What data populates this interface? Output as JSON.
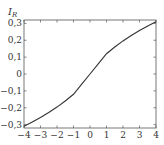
{
  "chart_data": {
    "type": "line",
    "title": "",
    "xlabel": "",
    "ylabel": "I_R",
    "ylabel_main": "I",
    "ylabel_sub": "R",
    "xlim": [
      -4,
      4
    ],
    "ylim": [
      -0.32,
      0.32
    ],
    "grid": false,
    "legend": null,
    "x_ticks": [
      -4,
      -3,
      -2,
      -1,
      0,
      1,
      2,
      3,
      4
    ],
    "x_tick_labels": [
      "−4",
      "−3",
      "−2",
      "−1",
      "0",
      "1",
      "2",
      "3",
      "4"
    ],
    "y_ticks": [
      -0.3,
      -0.2,
      -0.1,
      0,
      0.1,
      0.2,
      0.3
    ],
    "y_tick_labels": [
      "−0,3",
      "−0,2",
      "−0,1",
      "0",
      "0,1",
      "0,2",
      "0,3"
    ],
    "series": [
      {
        "name": "I_R",
        "color": "#333333",
        "x": [
          -4,
          -3.5,
          -3,
          -2.5,
          -2,
          -1.5,
          -1,
          -0.5,
          0,
          0.5,
          1,
          1.5,
          2,
          2.5,
          3,
          3.5,
          4
        ],
        "y": [
          -0.31,
          -0.285,
          -0.258,
          -0.228,
          -0.196,
          -0.16,
          -0.12,
          -0.06,
          0.0,
          0.06,
          0.12,
          0.16,
          0.196,
          0.228,
          0.258,
          0.285,
          0.31
        ]
      }
    ]
  }
}
